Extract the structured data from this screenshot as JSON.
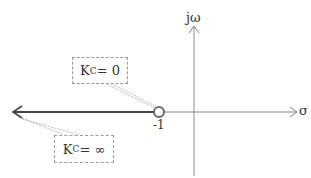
{
  "diagram": {
    "type": "root-locus",
    "axes": {
      "real_label": "σ",
      "imag_label": "jω"
    },
    "zero": {
      "label": "-1",
      "position": -1
    },
    "annotations": [
      {
        "id": "kc-zero",
        "k": "K",
        "sub": "C",
        "eq": " = 0"
      },
      {
        "id": "kc-inf",
        "k": "K",
        "sub": "C",
        "eq": " = ∞"
      }
    ],
    "colors": {
      "axis": "#777777",
      "locus": "#444444",
      "marker": "#666666"
    }
  }
}
